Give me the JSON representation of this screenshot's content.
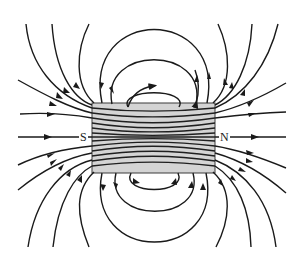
{
  "diagram": {
    "magnet": {
      "south_label": "S",
      "north_label": "N",
      "fill_color": "#d4d4d4",
      "line_color": "#1a1a1a"
    },
    "field_direction": "from N to S outside the magnet"
  }
}
